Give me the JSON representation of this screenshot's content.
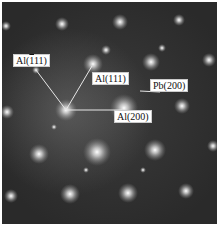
{
  "figure": {
    "type": "electron diffraction pattern",
    "background_color": "#2a2a2a",
    "spot_color": "#ffffff",
    "labels": [
      {
        "id": "al_bar111",
        "prefix": "Al(",
        "bar": "1",
        "rest": "11)",
        "text": "Al(-111)",
        "x": 13,
        "y": 54
      },
      {
        "id": "al_111",
        "text": "Al(111)",
        "x": 92,
        "y": 72
      },
      {
        "id": "pb_200",
        "text": "Pb(200)",
        "x": 150,
        "y": 79
      },
      {
        "id": "al_200",
        "text": "Al(200)",
        "x": 114,
        "y": 110
      }
    ],
    "center_spot": {
      "x": 66,
      "y": 110
    },
    "vectors": [
      {
        "to": "Al(-111)",
        "x2": 36,
        "y2": 70
      },
      {
        "to": "Al(111)",
        "x2": 92,
        "y2": 66
      },
      {
        "to": "Al(200)",
        "x2": 122,
        "y2": 110
      }
    ],
    "pb_marker": {
      "x1": 140,
      "y1": 91,
      "x2": 160,
      "y2": 92
    }
  }
}
